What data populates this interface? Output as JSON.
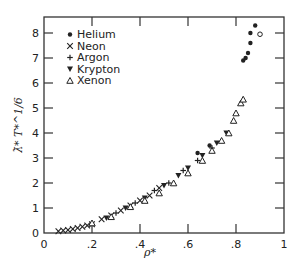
{
  "chart_data": {
    "type": "scatter",
    "title": "",
    "xlabel": "ρ*",
    "ylabel": "λ̄* T*^1/6",
    "xlim": [
      0,
      1
    ],
    "ylim": [
      0,
      8.6
    ],
    "x_ticks": [
      "0",
      ".2",
      ".4",
      ".6",
      ".8",
      "1"
    ],
    "y_ticks": [
      "0",
      "1",
      "2",
      "3",
      "4",
      "5",
      "6",
      "7",
      "8"
    ],
    "grid": false,
    "legend_position": "upper left",
    "legend": [
      "Helium",
      "Neon",
      "Argon",
      "Krypton",
      "Xenon"
    ],
    "series": [
      {
        "name": "Helium",
        "marker": "dot",
        "points": [
          [
            0.64,
            3.2
          ],
          [
            0.69,
            3.5
          ],
          [
            0.83,
            6.9
          ],
          [
            0.85,
            7.2
          ],
          [
            0.86,
            7.6
          ],
          [
            0.86,
            8.0
          ],
          [
            0.88,
            8.3
          ],
          [
            0.84,
            7.0
          ]
        ]
      },
      {
        "name": "Neon",
        "marker": "x",
        "points": [
          [
            0.06,
            0.07
          ],
          [
            0.08,
            0.1
          ],
          [
            0.1,
            0.12
          ],
          [
            0.12,
            0.16
          ],
          [
            0.14,
            0.2
          ],
          [
            0.16,
            0.25
          ],
          [
            0.18,
            0.3
          ],
          [
            0.2,
            0.35
          ],
          [
            0.24,
            0.55
          ],
          [
            0.28,
            0.7
          ],
          [
            0.32,
            0.9
          ],
          [
            0.36,
            1.1
          ],
          [
            0.4,
            1.3
          ],
          [
            0.44,
            1.5
          ],
          [
            0.48,
            1.8
          ]
        ]
      },
      {
        "name": "Argon",
        "marker": "plus",
        "points": [
          [
            0.3,
            0.8
          ],
          [
            0.38,
            1.2
          ],
          [
            0.46,
            1.7
          ],
          [
            0.52,
            2.0
          ],
          [
            0.58,
            2.5
          ],
          [
            0.64,
            2.9
          ],
          [
            0.7,
            3.4
          ]
        ]
      },
      {
        "name": "Krypton",
        "marker": "triangle-down-filled",
        "points": [
          [
            0.26,
            0.6
          ],
          [
            0.34,
            1.0
          ],
          [
            0.42,
            1.4
          ],
          [
            0.5,
            1.9
          ],
          [
            0.56,
            2.3
          ],
          [
            0.6,
            2.6
          ],
          [
            0.66,
            3.1
          ],
          [
            0.72,
            3.6
          ],
          [
            0.76,
            4.0
          ]
        ]
      },
      {
        "name": "Xenon",
        "marker": "triangle-up-open",
        "points": [
          [
            0.2,
            0.4
          ],
          [
            0.28,
            0.65
          ],
          [
            0.36,
            1.05
          ],
          [
            0.42,
            1.3
          ],
          [
            0.48,
            1.6
          ],
          [
            0.54,
            2.0
          ],
          [
            0.6,
            2.4
          ],
          [
            0.66,
            2.9
          ],
          [
            0.7,
            3.3
          ],
          [
            0.74,
            3.7
          ],
          [
            0.77,
            4.0
          ],
          [
            0.79,
            4.5
          ],
          [
            0.8,
            4.8
          ],
          [
            0.82,
            5.2
          ],
          [
            0.83,
            5.35
          ]
        ]
      }
    ]
  }
}
